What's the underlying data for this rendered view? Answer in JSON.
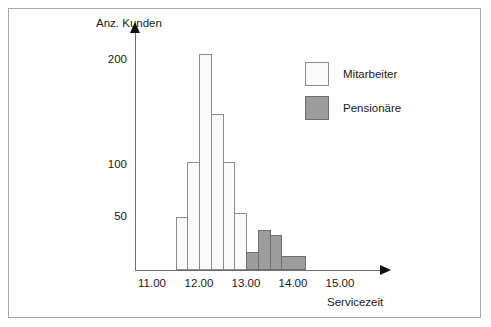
{
  "chart_data": {
    "type": "bar",
    "title": "",
    "subtitle": "",
    "xlabel": "Servicezeit",
    "ylabel": "Anz. Kunden",
    "xlim": [
      10.75,
      15.25
    ],
    "ylim": [
      0,
      230
    ],
    "grid": false,
    "legend_position": "top-right",
    "bin_width": 0.25,
    "x_ticks": [
      "11.00",
      "12.00",
      "13.00",
      "14.00",
      "15.00"
    ],
    "x_tick_values": [
      11.0,
      12.0,
      13.0,
      14.0,
      15.0
    ],
    "y_ticks": [
      "50",
      "100",
      "200"
    ],
    "y_tick_values": [
      50,
      100,
      200
    ],
    "legend": [
      {
        "name": "Mitarbeiter",
        "color": "#fafafa",
        "border": "#8c8c8c"
      },
      {
        "name": "Pensionäre",
        "color": "#9c9c9c",
        "border": "#6f6f6f"
      }
    ],
    "series": [
      {
        "name": "Mitarbeiter",
        "color": "#fafafa",
        "bins": [
          {
            "x0": 11.5,
            "x1": 11.75,
            "value": 51
          },
          {
            "x0": 11.75,
            "x1": 12.0,
            "value": 104
          },
          {
            "x0": 12.0,
            "x1": 12.25,
            "value": 207
          },
          {
            "x0": 12.25,
            "x1": 12.5,
            "value": 150
          },
          {
            "x0": 12.5,
            "x1": 12.75,
            "value": 104
          },
          {
            "x0": 12.75,
            "x1": 13.0,
            "value": 55
          }
        ]
      },
      {
        "name": "Pensionäre",
        "color": "#9c9c9c",
        "bins": [
          {
            "x0": 13.0,
            "x1": 13.25,
            "value": 17
          },
          {
            "x0": 13.25,
            "x1": 13.5,
            "value": 38
          },
          {
            "x0": 13.5,
            "x1": 13.75,
            "value": 34
          },
          {
            "x0": 13.75,
            "x1": 14.25,
            "value": 13
          }
        ]
      }
    ]
  }
}
